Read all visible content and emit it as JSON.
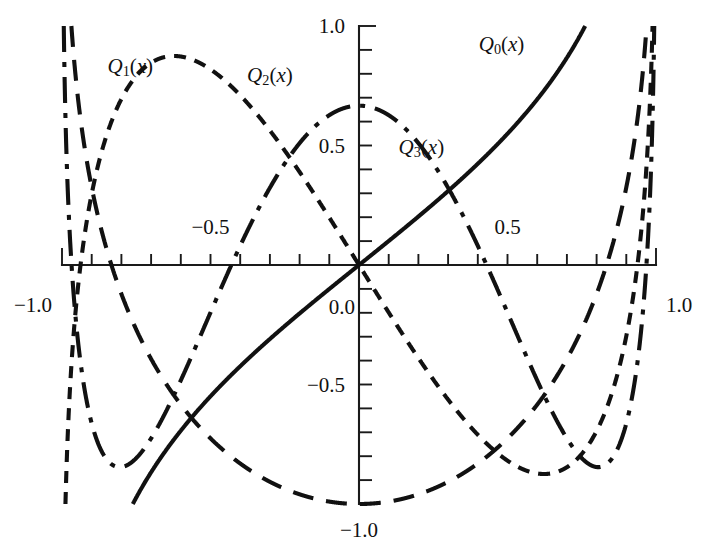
{
  "figure": {
    "title": "",
    "background_color": "#ffffff",
    "ink_color": "#111111"
  },
  "axes": {
    "x_axis_label": "",
    "y_axis_label": "",
    "x_tick_labels": [
      {
        "value": -1.0,
        "text": "−1.0"
      },
      {
        "value": -0.5,
        "text": "−0.5"
      },
      {
        "value": 0.5,
        "text": "0.5"
      },
      {
        "value": 1.0,
        "text": "1.0"
      }
    ],
    "y_tick_labels": [
      {
        "value": 1.0,
        "text": "1.0"
      },
      {
        "value": 0.5,
        "text": "0.5"
      },
      {
        "value": 0.0,
        "text": "0.0"
      },
      {
        "value": -0.5,
        "text": "−0.5"
      },
      {
        "value": -1.0,
        "text": "−1.0"
      }
    ],
    "x_minor_tick_step": 0.1,
    "y_minor_tick_step": 0.1,
    "x_range": [
      -1.0,
      1.0
    ],
    "y_range": [
      -1.0,
      1.0
    ],
    "grid": false,
    "spines": "cross-at-origin"
  },
  "series_labels": [
    {
      "id": "Q0",
      "base": "Q",
      "sub": "0",
      "arg": "(x)"
    },
    {
      "id": "Q1",
      "base": "Q",
      "sub": "1",
      "arg": "(x)"
    },
    {
      "id": "Q2",
      "base": "Q",
      "sub": "2",
      "arg": "(x)"
    },
    {
      "id": "Q3",
      "base": "Q",
      "sub": "3",
      "arg": "(x)"
    }
  ],
  "chart_data": {
    "type": "line",
    "xlabel": "x",
    "ylabel": "",
    "xlim": [
      -1.0,
      1.0
    ],
    "ylim": [
      -1.0,
      1.0
    ],
    "grid": false,
    "legend": "inline-curve-labels",
    "x_ticks": [
      -1.0,
      -0.5,
      0.0,
      0.5,
      1.0
    ],
    "y_ticks": [
      -1.0,
      -0.5,
      0.0,
      0.5,
      1.0
    ],
    "series": [
      {
        "name": "Q_0(x)",
        "label": "Q0(x)",
        "linestyle": "solid",
        "formula": "0.5*ln((1+x)/(1-x))",
        "x": [
          -0.95,
          -0.9,
          -0.8,
          -0.7,
          -0.6,
          -0.5,
          -0.4,
          -0.3,
          -0.2,
          -0.1,
          0.0,
          0.1,
          0.2,
          0.3,
          0.4,
          0.5,
          0.6,
          0.7,
          0.8,
          0.9,
          0.95
        ],
        "values": [
          -1.832,
          -1.472,
          -1.099,
          -0.867,
          -0.693,
          -0.549,
          -0.424,
          -0.31,
          -0.203,
          -0.1,
          0.0,
          0.1,
          0.203,
          0.31,
          0.424,
          0.549,
          0.693,
          0.867,
          1.099,
          1.472,
          1.832
        ]
      },
      {
        "name": "Q_1(x)",
        "label": "Q1(x)",
        "linestyle": "long-dash",
        "formula": "0.5*x*ln((1+x)/(1-x)) - 1",
        "x": [
          -0.97,
          -0.95,
          -0.9,
          -0.8,
          -0.7,
          -0.6,
          -0.5,
          -0.4,
          -0.3,
          -0.2,
          -0.1,
          0.0,
          0.1,
          0.2,
          0.3,
          0.4,
          0.5,
          0.6,
          0.7,
          0.8,
          0.9,
          0.95,
          0.97
        ],
        "values": [
          1.081,
          0.74,
          0.325,
          -0.121,
          -0.393,
          -0.584,
          -0.725,
          -0.83,
          -0.907,
          -0.959,
          -0.99,
          -1.0,
          -0.99,
          -0.959,
          -0.907,
          -0.83,
          -0.725,
          -0.584,
          -0.393,
          -0.121,
          0.325,
          0.74,
          1.081
        ]
      },
      {
        "name": "Q_2(x)",
        "label": "Q2(x)",
        "linestyle": "short-dash",
        "formula": "0.25*(3x^2-1)*ln((1+x)/(1-x)) - 1.5*x",
        "x": [
          -0.98,
          -0.95,
          -0.9,
          -0.8,
          -0.7,
          -0.6,
          -0.5,
          -0.4,
          -0.3,
          -0.2,
          -0.1,
          0.0,
          0.1,
          0.2,
          0.3,
          0.4,
          0.5,
          0.6,
          0.7,
          0.8,
          0.9,
          0.95,
          0.98
        ],
        "values": [
          -1.902,
          -1.104,
          -0.513,
          0.107,
          0.355,
          0.447,
          0.455,
          0.41,
          0.33,
          0.226,
          0.114,
          0.0,
          -0.114,
          -0.226,
          -0.33,
          -0.41,
          -0.455,
          -0.447,
          -0.355,
          -0.107,
          0.513,
          1.104,
          1.902
        ]
      },
      {
        "name": "Q_3(x)",
        "label": "Q3(x)",
        "linestyle": "dash-dot",
        "formula": "0.25*(5x^3-3x)*ln((1+x)/(1-x)) - 2.5*x^2 + 2/3",
        "x": [
          -0.98,
          -0.95,
          -0.9,
          -0.8,
          -0.7,
          -0.6,
          -0.5,
          -0.4,
          -0.3,
          -0.2,
          -0.1,
          0.0,
          0.1,
          0.2,
          0.3,
          0.4,
          0.5,
          0.6,
          0.7,
          0.8,
          0.9,
          0.95,
          0.98
        ],
        "values": [
          1.868,
          1.024,
          0.392,
          -0.259,
          -0.48,
          -0.509,
          -0.443,
          -0.334,
          -0.21,
          -0.087,
          0.026,
          0.125,
          0.208,
          0.271,
          0.309,
          0.317,
          0.285,
          0.2,
          0.038,
          -0.248,
          -0.385,
          -0.02,
          0.844
        ]
      }
    ],
    "annotations": [
      {
        "text": "Q1(x)",
        "x": -0.77,
        "y": 0.83
      },
      {
        "text": "Q2(x)",
        "x": -0.3,
        "y": 0.79
      },
      {
        "text": "Q3(x)",
        "x": 0.21,
        "y": 0.49
      },
      {
        "text": "Q0(x)",
        "x": 0.48,
        "y": 0.92
      }
    ]
  }
}
